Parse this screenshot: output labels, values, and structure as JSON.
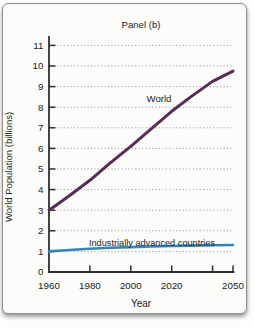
{
  "chart_data": {
    "type": "line",
    "title": "Panel (b)",
    "xlabel": "Year",
    "ylabel": "World Population (billions)",
    "x_range": [
      1960,
      2050
    ],
    "y_range": [
      0,
      11
    ],
    "y_ticks": [
      0,
      1,
      2,
      3,
      4,
      5,
      6,
      7,
      8,
      9,
      10,
      11
    ],
    "x_tick_marks": [
      1980,
      2000,
      2020,
      2040,
      2050
    ],
    "x_tick_labels": [
      1960,
      1980,
      2000,
      2020,
      2050
    ],
    "grid": "dotted-horizontal",
    "legend_position": "labels-on-chart",
    "colors": {
      "world_line": "#5b2a58",
      "advanced_line": "#2f87be",
      "axis": "#2f2f2f",
      "gridline": "#8f8f8f"
    },
    "series": [
      {
        "name": "World",
        "color": "#5b2a58",
        "x": [
          1960,
          1970,
          1980,
          1990,
          2000,
          2010,
          2020,
          2030,
          2040,
          2050
        ],
        "y": [
          3.0,
          3.7,
          4.45,
          5.3,
          6.1,
          6.95,
          7.8,
          8.55,
          9.25,
          9.75
        ]
      },
      {
        "name": "Industrially advanced countries",
        "color": "#2f87be",
        "x": [
          1960,
          1970,
          1980,
          1990,
          2000,
          2010,
          2020,
          2030,
          2040,
          2050
        ],
        "y": [
          1.0,
          1.07,
          1.13,
          1.18,
          1.21,
          1.24,
          1.26,
          1.28,
          1.3,
          1.31
        ]
      }
    ]
  }
}
